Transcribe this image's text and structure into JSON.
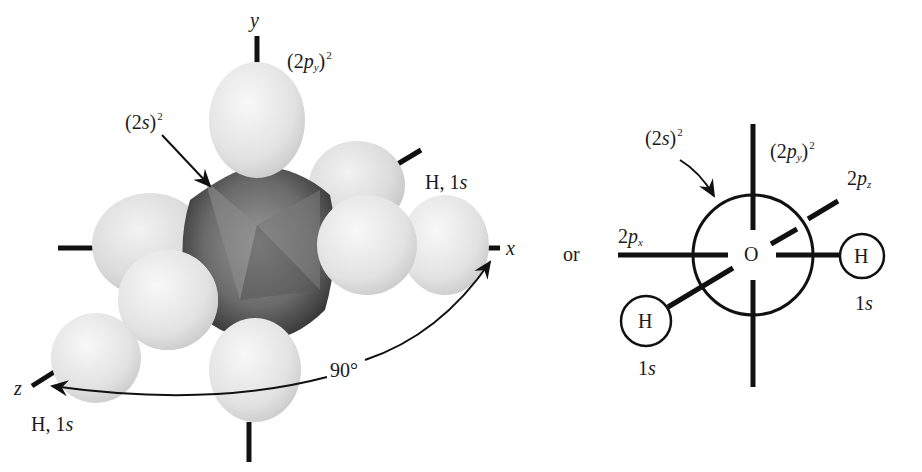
{
  "figure": {
    "left_panel": {
      "description": "Space-filling model of O 2s/2p orbitals with two H 1s orbitals",
      "axes": {
        "y": "y",
        "x": "x",
        "z": "z"
      },
      "labels": {
        "py_label_base": "(2",
        "py_label_p": "p",
        "py_label_sub": "y",
        "py_label_close": ")",
        "py_label_sup": "2",
        "s_label_base": "(2",
        "s_label_s": "s",
        "s_label_close": ")",
        "s_label_sup": "2",
        "h_upper": "H, 1",
        "h_upper_s": "s",
        "h_lower": "H, 1",
        "h_lower_s": "s",
        "angle": "90°"
      }
    },
    "connector": "or",
    "right_panel": {
      "description": "Schematic of water: O with (2s)^2 sphere, 2p axes, H 1s circles",
      "center_atom": "O",
      "labels": {
        "s_base": "(2",
        "s_s": "s",
        "s_close": ")",
        "s_sup": "2",
        "py_base": "(2",
        "py_p": "p",
        "py_sub": "y",
        "py_close": ")",
        "py_sup": "2",
        "pz_base": "2",
        "pz_p": "p",
        "pz_sub": "z",
        "px_base": "2",
        "px_p": "p",
        "px_sub": "x"
      },
      "hydrogens": [
        {
          "symbol": "H",
          "orbital_num": "1",
          "orbital_s": "s"
        },
        {
          "symbol": "H",
          "orbital_num": "1",
          "orbital_s": "s"
        }
      ]
    },
    "colors": {
      "ink": "#111111",
      "lobe_light": "#e6e6e6",
      "lobe_mid": "#cfcfcf",
      "core_dark": "#3a3a3a"
    }
  }
}
